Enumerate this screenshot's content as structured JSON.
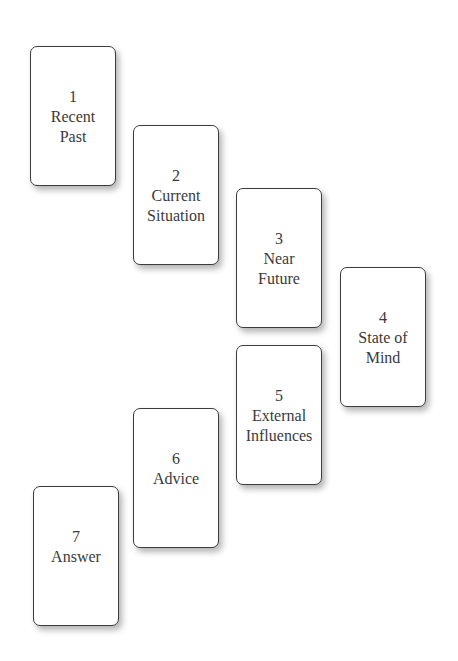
{
  "spread": {
    "cards": [
      {
        "number": "1",
        "label": "Recent\nPast"
      },
      {
        "number": "2",
        "label": "Current\nSituation"
      },
      {
        "number": "3",
        "label": "Near\nFuture"
      },
      {
        "number": "4",
        "label": "State of\nMind"
      },
      {
        "number": "5",
        "label": "External\nInfluences"
      },
      {
        "number": "6",
        "label": "Advice"
      },
      {
        "number": "7",
        "label": "Answer"
      }
    ]
  }
}
